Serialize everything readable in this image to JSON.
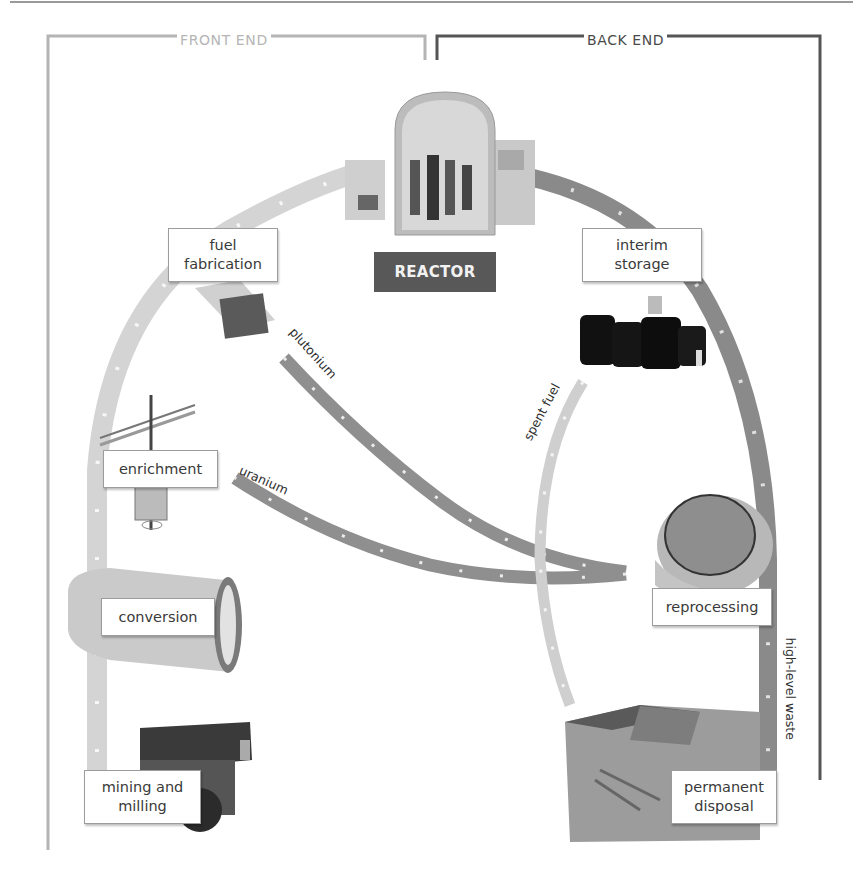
{
  "diagram": {
    "title_front": "FRONT END",
    "title_back": "BACK END",
    "center": {
      "label": "REACTOR"
    },
    "stages_front_end": [
      {
        "id": "mining",
        "label_line1": "mining and",
        "label_line2": "milling"
      },
      {
        "id": "conversion",
        "label_line1": "conversion"
      },
      {
        "id": "enrichment",
        "label_line1": "enrichment"
      },
      {
        "id": "fabrication",
        "label_line1": "fuel",
        "label_line2": "fabrication"
      }
    ],
    "stages_back_end": [
      {
        "id": "interim",
        "label_line1": "interim",
        "label_line2": "storage"
      },
      {
        "id": "reprocessing",
        "label_line1": "reprocessing"
      },
      {
        "id": "disposal",
        "label_line1": "permanent",
        "label_line2": "disposal"
      }
    ],
    "flows": {
      "plutonium": "plutonium",
      "uranium": "uranium",
      "spent_fuel": "spent fuel",
      "high_level_waste": "high-level waste"
    },
    "colors": {
      "front_end_frame": "#b4b4b4",
      "back_end_frame": "#555555",
      "front_arrow": "#d4d4d4",
      "back_arrow": "#8a8a8a",
      "recycle_arrow": "#8f8f8f",
      "spent_fuel_arrow": "#cfcfcf",
      "reactor_label_bg": "#585858"
    }
  }
}
